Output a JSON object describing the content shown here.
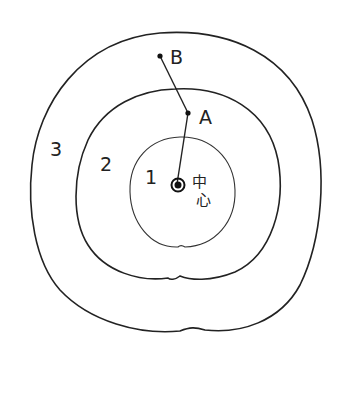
{
  "diagram": {
    "rings": [
      {
        "id": "ring-1",
        "label": "1"
      },
      {
        "id": "ring-2",
        "label": "2"
      },
      {
        "id": "ring-3",
        "label": "3"
      }
    ],
    "points": {
      "a": {
        "label": "A"
      },
      "b": {
        "label": "B"
      }
    },
    "center": {
      "label_line1": "中",
      "label_line2": "心"
    }
  },
  "colors": {
    "ink": "#222222",
    "background": "#ffffff"
  }
}
